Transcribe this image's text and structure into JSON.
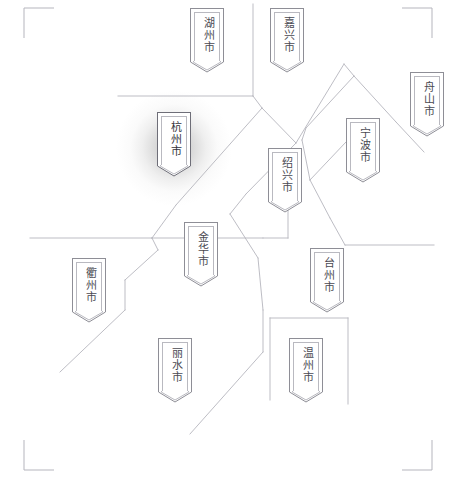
{
  "map": {
    "title": "浙江省地级市分布图",
    "region": "浙江省",
    "background_color": "#ffffff",
    "boundary_color": "#b5b5bd",
    "marker_border_color": "#8e8e96",
    "marker_inner_border_color": "#b9b9c0",
    "label_color": "#4a4a52",
    "highlight_glow_color": "#8c8c8c",
    "highlighted_city": "杭州市",
    "corner_marks": [
      {
        "name": "top-left",
        "x": 24,
        "y": 8,
        "h_dir": 1,
        "v_dir": 1
      },
      {
        "name": "top-right",
        "x": 432,
        "y": 8,
        "h_dir": -1,
        "v_dir": 1
      },
      {
        "name": "bottom-left",
        "x": 24,
        "y": 470,
        "h_dir": 1,
        "v_dir": -1
      },
      {
        "name": "bottom-right",
        "x": 432,
        "y": 470,
        "h_dir": -1,
        "v_dir": -1
      }
    ],
    "boundary_paths": [
      "M 118 96 L 253 96",
      "M 253 96 L 253 4",
      "M 253 96 L 262 108",
      "M 262 108 L 176 205",
      "M 176 205 L 152 238",
      "M 152 238 L 30 238",
      "M 152 238 L 158 250",
      "M 158 250 L 125 280",
      "M 125 280 L 125 310",
      "M 125 310 L 60 372",
      "M 262 108 L 296 143",
      "M 296 143 L 246 194",
      "M 246 194 L 230 214",
      "M 230 214 L 258 258",
      "M 258 258 L 263 310",
      "M 263 310 L 263 352",
      "M 263 352 L 190 434",
      "M 296 143 L 344 64",
      "M 344 64 L 354 76",
      "M 354 76 L 396 122",
      "M 396 122 L 424 152",
      "M 354 76 L 306 128",
      "M 306 128 L 302 140",
      "M 302 140 L 310 180",
      "M 310 180 L 330 218",
      "M 330 218 L 345 245",
      "M 310 180 L 346 142",
      "M 152 238 L 263 238",
      "M 263 238 L 288 238",
      "M 288 238 L 288 196",
      "M 345 245 L 434 245",
      "M 270 318 L 348 318",
      "M 270 318 L 270 400",
      "M 348 318 L 348 404"
    ],
    "cities": [
      {
        "id": "huzhou",
        "name": "湖州市",
        "x": 190,
        "y": 8,
        "body_h": 54,
        "highlighted": false
      },
      {
        "id": "jiaxing",
        "name": "嘉兴市",
        "x": 270,
        "y": 8,
        "body_h": 54,
        "highlighted": false
      },
      {
        "id": "zhoushan",
        "name": "舟山市",
        "x": 410,
        "y": 72,
        "body_h": 54,
        "highlighted": false
      },
      {
        "id": "ningbo",
        "name": "宁波市",
        "x": 346,
        "y": 118,
        "body_h": 54,
        "highlighted": false
      },
      {
        "id": "hangzhou",
        "name": "杭州市",
        "x": 157,
        "y": 112,
        "body_h": 54,
        "highlighted": true
      },
      {
        "id": "shaoxing",
        "name": "绍兴市",
        "x": 268,
        "y": 148,
        "body_h": 54,
        "highlighted": false
      },
      {
        "id": "jinhua",
        "name": "金华市",
        "x": 184,
        "y": 222,
        "body_h": 54,
        "highlighted": false
      },
      {
        "id": "taizhou",
        "name": "台州市",
        "x": 310,
        "y": 248,
        "body_h": 54,
        "highlighted": false
      },
      {
        "id": "quzhou",
        "name": "衢州市",
        "x": 72,
        "y": 258,
        "body_h": 54,
        "highlighted": false
      },
      {
        "id": "lishui",
        "name": "丽水市",
        "x": 158,
        "y": 338,
        "body_h": 54,
        "highlighted": false
      },
      {
        "id": "wenzhou",
        "name": "温州市",
        "x": 289,
        "y": 338,
        "body_h": 54,
        "highlighted": false
      }
    ],
    "glow": {
      "cx": 174,
      "cy": 148,
      "r": 58
    }
  }
}
